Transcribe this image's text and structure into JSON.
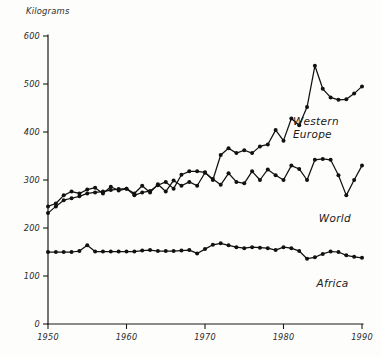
{
  "chart_data": {
    "type": "line",
    "title": "",
    "subtitle": "",
    "xlabel": "",
    "ylabel": "Kilograms",
    "xlim": [
      1950,
      1990
    ],
    "ylim": [
      0,
      600
    ],
    "xticks": [
      1950,
      1960,
      1970,
      1980,
      1990
    ],
    "xtick_labels": [
      "1950",
      "1960",
      "1970",
      "1980",
      "1990"
    ],
    "yticks": [
      0,
      100,
      200,
      300,
      400,
      500,
      600
    ],
    "ytick_labels": [
      "0",
      "100",
      "200",
      "300",
      "400",
      "500",
      "600"
    ],
    "grid": false,
    "legend_position": "inline-right",
    "line_color": "#111111",
    "marker_color": "#111111",
    "x": [
      1950,
      1951,
      1952,
      1953,
      1954,
      1955,
      1956,
      1957,
      1958,
      1959,
      1960,
      1961,
      1962,
      1963,
      1964,
      1965,
      1966,
      1967,
      1968,
      1969,
      1970,
      1971,
      1972,
      1973,
      1974,
      1975,
      1976,
      1977,
      1978,
      1979,
      1980,
      1981,
      1982,
      1983,
      1984,
      1985,
      1986,
      1987,
      1988,
      1989,
      1990
    ],
    "series": [
      {
        "name": "Western Europe",
        "label": "Western Europe",
        "label_lines": [
          "Western",
          "Europe"
        ],
        "label_x": 1981.2,
        "label_y": 415,
        "values": [
          231,
          245,
          258,
          262,
          266,
          272,
          274,
          276,
          279,
          281,
          282,
          268,
          274,
          277,
          289,
          296,
          282,
          311,
          318,
          318,
          316,
          300,
          352,
          366,
          356,
          362,
          356,
          370,
          374,
          404,
          382,
          428,
          414,
          452,
          538,
          490,
          472,
          467,
          468,
          480,
          495
        ]
      },
      {
        "name": "World",
        "label": "World",
        "label_lines": [
          "World"
        ],
        "label_x": 1984.5,
        "label_y": 212,
        "values": [
          245,
          251,
          268,
          276,
          272,
          280,
          284,
          272,
          286,
          278,
          282,
          272,
          288,
          274,
          291,
          276,
          299,
          288,
          296,
          288,
          315,
          302,
          290,
          314,
          296,
          293,
          318,
          300,
          322,
          310,
          300,
          330,
          323,
          300,
          342,
          344,
          342,
          310,
          268,
          300,
          330
        ]
      },
      {
        "name": "Africa",
        "label": "Africa",
        "label_lines": [
          "Africa"
        ],
        "label_x": 1984.2,
        "label_y": 78,
        "values": [
          150,
          150,
          150,
          150,
          152,
          164,
          151,
          151,
          151,
          151,
          151,
          151,
          153,
          154,
          152,
          152,
          152,
          153,
          154,
          147,
          156,
          165,
          168,
          164,
          160,
          158,
          160,
          159,
          158,
          154,
          160,
          158,
          152,
          136,
          139,
          146,
          151,
          150,
          143,
          140,
          138
        ]
      }
    ]
  },
  "figure": {
    "axis_color": "#1a1a1a",
    "background": "#fdfdfb"
  }
}
